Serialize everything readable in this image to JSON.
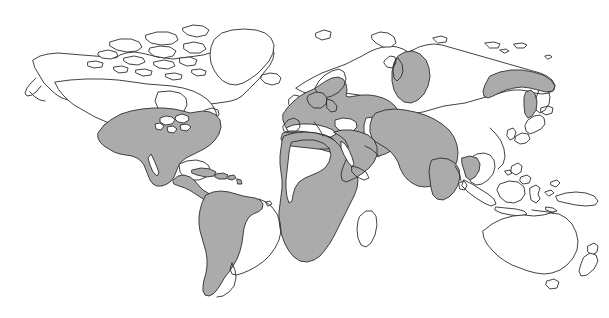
{
  "figure": {
    "type": "world-distribution-map",
    "title": "",
    "caption": "",
    "background_color": "#ffffff",
    "outline_color": "#2e2e2e",
    "shading_color": "#ababab",
    "width": 609,
    "height": 318,
    "projection": "equirectangular"
  },
  "legend": {
    "visible": false,
    "entries": [
      {
        "label": "",
        "swatch_color": "#ababab",
        "meaning": "shaded-distribution-range"
      },
      {
        "label": "",
        "swatch_color": "#ffffff",
        "meaning": "unshaded-land"
      }
    ]
  },
  "regions": {
    "shaded": [
      {
        "name": "North America (contiguous United States and Mexico)",
        "id": "region-north-america"
      },
      {
        "name": "Central America and Caribbean",
        "id": "region-central-america"
      },
      {
        "name": "Western and southern South America (Andes, Amazon, Patagonia)",
        "id": "region-south-america"
      },
      {
        "name": "Europe including southern Scandinavia",
        "id": "region-europe"
      },
      {
        "name": "North Africa coastal belt",
        "id": "region-north-africa"
      },
      {
        "name": "East and Southern Africa",
        "id": "region-east-south-africa"
      },
      {
        "name": "Middle East and Arabian Peninsula",
        "id": "region-middle-east"
      },
      {
        "name": "Central Asia, South Asia and China",
        "id": "region-central-east-asia"
      },
      {
        "name": "Western Siberia isolate",
        "id": "region-west-siberia-patch"
      },
      {
        "name": "Northeastern Siberia and Sakhalin isolate",
        "id": "region-northeast-siberia-patch"
      }
    ],
    "unshaded": [
      {
        "name": "Canada, Alaska and Arctic archipelago",
        "id": "region-canada"
      },
      {
        "name": "Greenland",
        "id": "region-greenland"
      },
      {
        "name": "Iceland",
        "id": "region-iceland"
      },
      {
        "name": "Sahara and West-Central Africa",
        "id": "region-sahara"
      },
      {
        "name": "Madagascar",
        "id": "region-madagascar"
      },
      {
        "name": "Eastern Brazil and the Southern Cone lowlands",
        "id": "region-east-brazil"
      },
      {
        "name": "Northern Siberia",
        "id": "region-north-siberia"
      },
      {
        "name": "Japan and Korea",
        "id": "region-japan-korea"
      },
      {
        "name": "Southeast Asia and Indonesia",
        "id": "region-southeast-asia"
      },
      {
        "name": "New Guinea",
        "id": "region-new-guinea"
      },
      {
        "name": "Australia",
        "id": "region-australia"
      },
      {
        "name": "New Zealand",
        "id": "region-new-zealand"
      }
    ]
  },
  "labels": [],
  "annotations": []
}
